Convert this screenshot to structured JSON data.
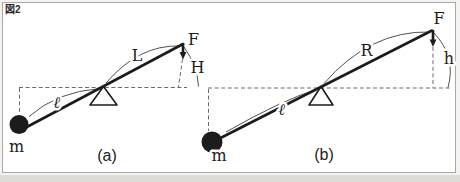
{
  "figure": {
    "tag": "図2"
  },
  "colors": {
    "ink": "#1c1c1c",
    "dashed": "#6a6a6a",
    "frame": "#a9a9a4",
    "page_bg": "#f4f3f1",
    "panel_bg": "#ffffff"
  },
  "diagram_a": {
    "caption": "(a)",
    "labels": {
      "force": "F",
      "height": "H",
      "long_arm": "L",
      "short_arm": "ℓ",
      "mass": "m"
    }
  },
  "diagram_b": {
    "caption": "(b)",
    "labels": {
      "force": "F",
      "height": "h",
      "long_arm": "R",
      "short_arm": "ℓ",
      "mass": "m"
    }
  }
}
